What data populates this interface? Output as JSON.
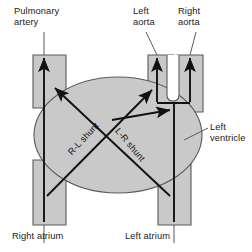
{
  "diagram": {
    "colors": {
      "chamber_fill": "#c9c9c9",
      "outline": "#555555",
      "arrow": "#111111",
      "leader": "#555555",
      "text": "#1a1a1a",
      "background": "#ffffff"
    }
  },
  "labels": {
    "pulmonary_artery": "Pulmonary\nartery",
    "left_aorta": "Left\naorta",
    "right_aorta": "Right\naorta",
    "left_ventricle": "Left\nventricle",
    "right_atrium": "Right atrium",
    "left_atrium": "Left atrium",
    "rl_shunt": "R-L shunt",
    "lr_shunt": "L-R shunt"
  },
  "structures": [
    {
      "name": "left-ventricle-chamber",
      "shape": "ellipse",
      "cx": 118,
      "cy": 135,
      "rx": 84,
      "ry": 58
    },
    {
      "name": "pulmonary-artery-trunk",
      "shape": "vessel",
      "x": 33,
      "y": 55,
      "w": 33
    },
    {
      "name": "left-aorta-trunk",
      "shape": "vessel",
      "x": 148,
      "y": 55,
      "w": 26
    },
    {
      "name": "right-aorta-trunk",
      "shape": "vessel",
      "x": 177,
      "y": 55,
      "w": 26
    },
    {
      "name": "right-atrium-trunk",
      "shape": "vessel",
      "x": 33,
      "y": 190,
      "w": 33
    },
    {
      "name": "left-atrium-trunk",
      "shape": "vessel",
      "x": 158,
      "y": 190,
      "w": 33
    }
  ],
  "flow_arrows": [
    {
      "name": "pulmonary-artery-flow",
      "direction": "up"
    },
    {
      "name": "left-aorta-flow",
      "direction": "up"
    },
    {
      "name": "right-aorta-flow",
      "direction": "up"
    },
    {
      "name": "left-atrium-to-aortas-flow",
      "direction": "up-branching"
    },
    {
      "name": "rl-shunt-arrow",
      "direction": "up-left"
    },
    {
      "name": "lr-shunt-arrow",
      "direction": "up-right"
    }
  ]
}
